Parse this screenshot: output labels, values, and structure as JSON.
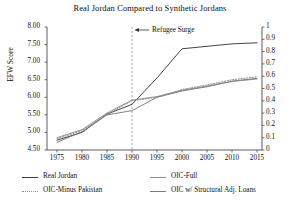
{
  "chart_data": {
    "type": "line",
    "title": "Real Jordan Compared to Synthetic Jordans",
    "xlabel": "",
    "ylabel": "EFW Score",
    "y2label": "",
    "xlim": [
      1973,
      2016
    ],
    "ylim": [
      4.5,
      8.0
    ],
    "y2lim": [
      0,
      1
    ],
    "grid": false,
    "legend_position": "below",
    "xticks": [
      1975,
      1980,
      1985,
      1990,
      1995,
      2000,
      2005,
      2010,
      2015
    ],
    "yticks": [
      "8.00",
      "7.50",
      "7.00",
      "6.50",
      "6.00",
      "5.50",
      "5.00",
      "4.50"
    ],
    "y2ticks": [
      "1",
      "0.9",
      "0.8",
      "0.7",
      "0.6",
      "0.5",
      "0.4",
      "0.3",
      "0.2",
      "0.1",
      "0"
    ],
    "x": [
      1975,
      1980,
      1985,
      1990,
      1995,
      2000,
      2005,
      2010,
      2015
    ],
    "series": [
      {
        "name": "Real Jordan",
        "style": "solid",
        "color": "#3a3a3a",
        "values": [
          4.78,
          5.0,
          5.52,
          5.8,
          6.55,
          7.38,
          7.45,
          7.52,
          7.55
        ]
      },
      {
        "name": "OIC-Full",
        "style": "solid",
        "color": "#8e8e8e",
        "values": [
          4.85,
          5.08,
          5.55,
          5.92,
          6.02,
          6.2,
          6.32,
          6.45,
          6.52
        ]
      },
      {
        "name": "OIC-Minus Pakistan",
        "style": "dotted",
        "color": "#8e8e8e",
        "values": [
          4.82,
          5.05,
          5.52,
          5.9,
          6.0,
          6.22,
          6.35,
          6.5,
          6.58
        ]
      },
      {
        "name": "OIC w/ Structural Adj. Loans",
        "style": "solid",
        "color": "#7a7a7a",
        "values": [
          4.72,
          5.02,
          5.5,
          5.62,
          6.0,
          6.18,
          6.3,
          6.46,
          6.54
        ]
      }
    ],
    "annotations": [
      {
        "label": "Refugee Surge",
        "x": 1990,
        "type": "vline-callout",
        "line_style": "dashed",
        "line_color": "#9a9a9a"
      }
    ]
  },
  "legend": {
    "items": [
      {
        "label": "Real Jordan",
        "style": "solid",
        "column": 1,
        "row": 1
      },
      {
        "label": "OIC-Full",
        "style": "solid-light",
        "column": 2,
        "row": 1
      },
      {
        "label": "OIC-Minus Pakistan",
        "style": "dotted",
        "column": 1,
        "row": 2
      },
      {
        "label": "OIC w/ Structural Adj. Loans",
        "style": "solid-mid",
        "column": 2,
        "row": 2
      }
    ]
  }
}
